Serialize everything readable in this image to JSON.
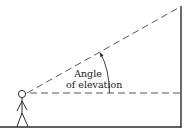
{
  "diagram": {
    "label_line1": "Angle",
    "label_line2": "of elevation",
    "colors": {
      "stroke": "#2a2a2a",
      "background": "#ffffff"
    }
  }
}
